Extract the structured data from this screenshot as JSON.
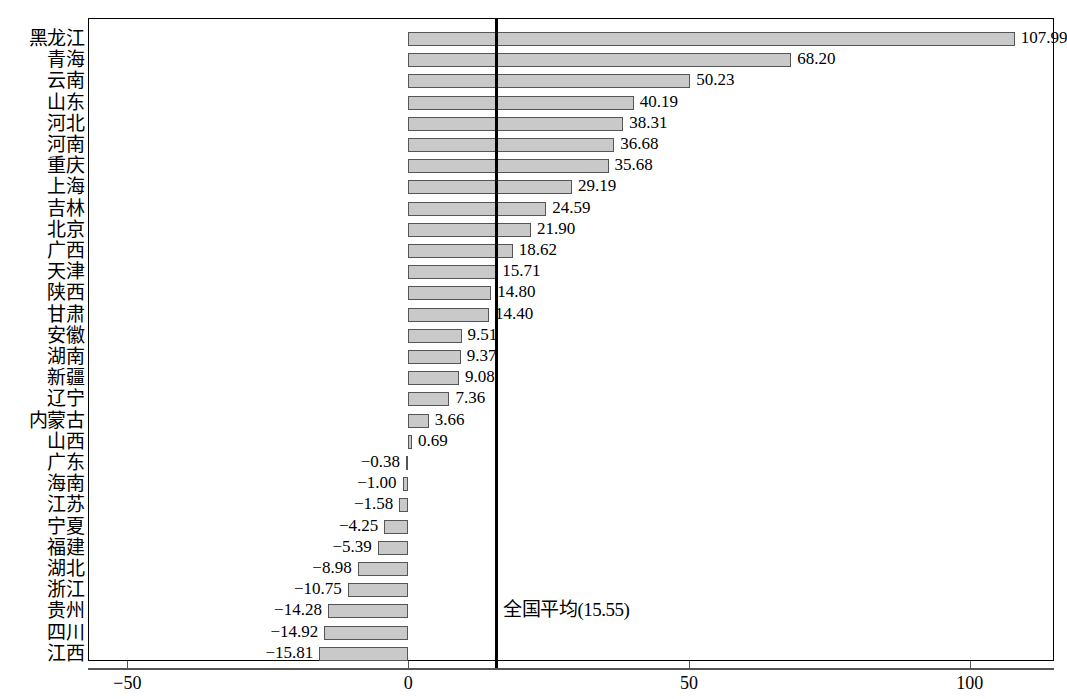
{
  "chart_data": {
    "type": "bar",
    "orientation": "horizontal",
    "title": "",
    "subtitle": "",
    "xlabel": "",
    "ylabel": "",
    "xlim": [
      -57,
      115
    ],
    "xticks": [
      -50,
      0,
      50,
      100
    ],
    "xtick_labels": [
      "−50",
      "0",
      "50",
      "100"
    ],
    "grid": false,
    "legend": null,
    "categories": [
      "黑龙江",
      "青海",
      "云南",
      "山东",
      "河北",
      "河南",
      "重庆",
      "上海",
      "吉林",
      "北京",
      "广西",
      "天津",
      "陕西",
      "甘肃",
      "安徽",
      "湖南",
      "新疆",
      "辽宁",
      "内蒙古",
      "山西",
      "广东",
      "海南",
      "江苏",
      "宁夏",
      "福建",
      "湖北",
      "浙江",
      "贵州",
      "四川",
      "江西"
    ],
    "values": [
      107.99,
      68.2,
      50.23,
      40.19,
      38.31,
      36.68,
      35.68,
      29.19,
      24.59,
      21.9,
      18.62,
      15.71,
      14.8,
      14.4,
      9.51,
      9.37,
      9.08,
      7.36,
      3.66,
      0.69,
      -0.38,
      -1.0,
      -1.58,
      -4.25,
      -5.39,
      -8.98,
      -10.75,
      -14.28,
      -14.92,
      -15.81
    ],
    "value_labels": [
      "107.99",
      "68.20",
      "50.23",
      "40.19",
      "38.31",
      "36.68",
      "35.68",
      "29.19",
      "24.59",
      "21.90",
      "18.62",
      "15.71",
      "14.80",
      "14.40",
      "9.51",
      "9.37",
      "9.08",
      "7.36",
      "3.66",
      "0.69",
      "−0.38",
      "−1.00",
      "−1.58",
      "−4.25",
      "−5.39",
      "−8.98",
      "−10.75",
      "−14.28",
      "−14.92",
      "−15.81"
    ],
    "reference_line": {
      "value": 15.55,
      "label": "全国平均(15.55)",
      "color": "#000000"
    },
    "colors": {
      "bar_fill": "#c9c9c9",
      "bar_border": "#555555",
      "axis": "#555555",
      "frame": "#000000",
      "text": "#000000"
    }
  }
}
